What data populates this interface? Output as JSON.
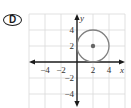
{
  "choice": {
    "label": "D"
  },
  "chart_data": {
    "type": "scatter",
    "title": "",
    "xlabel": "x",
    "ylabel": "y",
    "xlim": [
      -6,
      6
    ],
    "ylim": [
      -5.75,
      6
    ],
    "grid": true,
    "grid_step": 2,
    "x_ticks": [
      {
        "value": -4,
        "label": "−4"
      },
      {
        "value": -2,
        "label": "−2"
      },
      {
        "value": 2,
        "label": "2"
      },
      {
        "value": 4,
        "label": "4"
      }
    ],
    "y_ticks": [
      {
        "value": 4,
        "label": "4"
      },
      {
        "value": 2,
        "label": "2"
      },
      {
        "value": -2,
        "label": "−2"
      },
      {
        "value": -4,
        "label": "−4"
      }
    ],
    "shapes": [
      {
        "kind": "circle",
        "center": [
          2,
          2
        ],
        "radius": 2,
        "stroke": "#808080",
        "center_point_color": "#666666"
      }
    ],
    "colors": {
      "grid": "#d9d9d9",
      "axis": "#1a1a1a",
      "circle": "#808080"
    }
  }
}
